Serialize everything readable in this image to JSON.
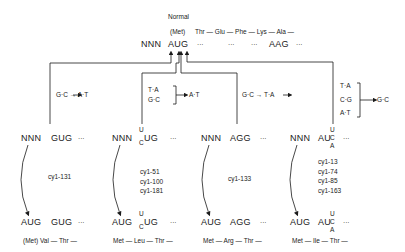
{
  "normal": {
    "label": "Normal",
    "codon_row": {
      "prefix": "NNN",
      "start_codon": "AUG",
      "dots": [
        "···",
        "···",
        "···",
        "···"
      ],
      "lys_codon": "AAG"
    },
    "protein_row": {
      "first": "(Met)",
      "sequence": "Thr — Glu — Phe — Lys — Ala —"
    }
  },
  "mutations": [
    {
      "change": "G·C → A·T"
    },
    {
      "change_from": [
        "T·A",
        "G·C"
      ],
      "change_to": "A·T"
    },
    {
      "change": "G·C → T·A"
    },
    {
      "change_from": [
        "T·A",
        "C·G",
        "A·T"
      ],
      "change_to": "G·C"
    }
  ],
  "mutants": [
    {
      "codon_row": {
        "prefix": "NNN",
        "codon": "GUG",
        "dots": "···"
      },
      "alleles": [
        "cy1-131"
      ],
      "rev_codon_row": {
        "start": "AUG",
        "codon": "GUG",
        "dots": "···"
      },
      "protein": "(Met)   Val — Thr —"
    },
    {
      "codon_row": {
        "prefix": "NNN",
        "codon_top": "U",
        "codon_bottom": "C",
        "codon_rest": "UG",
        "dots": "···"
      },
      "alleles": [
        "cy1-51",
        "cy1-100",
        "cy1-181"
      ],
      "rev_codon_row": {
        "start": "AUG",
        "codon_top": "U",
        "codon_bottom": "C",
        "codon_rest": "UG",
        "dots": "···"
      },
      "protein": "Met — Leu — Thr —"
    },
    {
      "codon_row": {
        "prefix": "NNN",
        "codon": "AGG",
        "dots": "···"
      },
      "alleles": [
        "cy1-133"
      ],
      "rev_codon_row": {
        "start": "AUG",
        "codon": "AGG",
        "dots": "···"
      },
      "protein": "Met — Arg — Thr —"
    },
    {
      "codon_row": {
        "prefix": "NNN",
        "codon_base": "AU",
        "codon_top": "U",
        "codon_mid": "C",
        "codon_bottom": "A",
        "dots": "···"
      },
      "alleles": [
        "cy1-13",
        "cy1-74",
        "cy1-85",
        "cy1-163"
      ],
      "rev_codon_row": {
        "start": "AUG",
        "codon_base": "AU",
        "codon_top": "U",
        "codon_mid": "C",
        "codon_bottom": "A",
        "dots": "···"
      },
      "protein": "Met — Ile — Thr —"
    }
  ]
}
